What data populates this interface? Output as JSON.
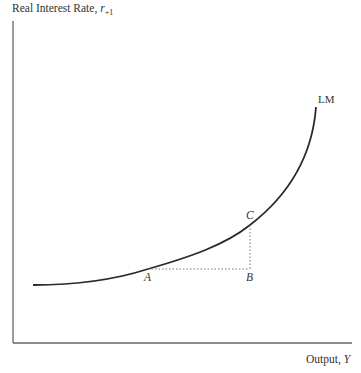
{
  "diagram": {
    "y_axis_label": "Real Interest Rate, ",
    "y_axis_symbol": "r",
    "y_axis_subscript": "+1",
    "x_axis_label": "Output, ",
    "x_axis_symbol": "Y",
    "curve_label": "LM",
    "points": [
      {
        "label": "A",
        "x": 148,
        "y": 269
      },
      {
        "label": "B",
        "x": 250,
        "y": 269
      },
      {
        "label": "C",
        "x": 250,
        "y": 225
      }
    ],
    "colors": {
      "axis": "#666666",
      "curve": "#2a2a2a",
      "dotted": "#777777"
    }
  }
}
